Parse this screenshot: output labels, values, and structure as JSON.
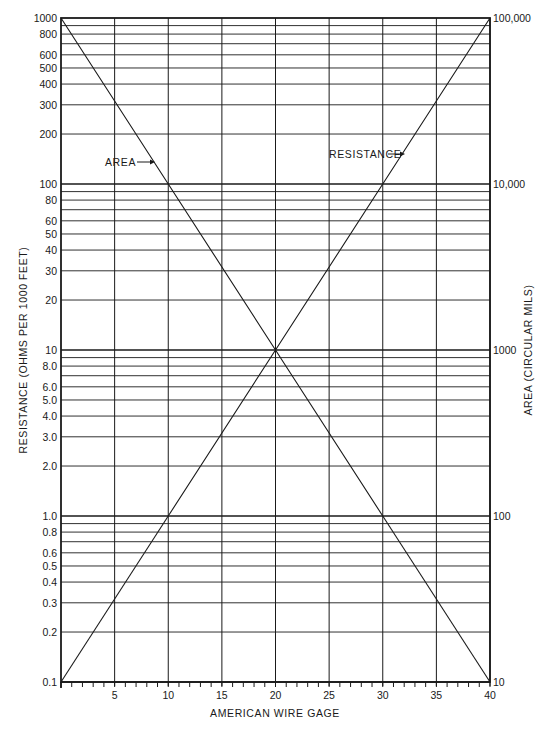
{
  "chart_data": {
    "type": "line",
    "title": "",
    "xlabel": "AMERICAN WIRE GAGE",
    "ylabel": "RESISTANCE (OHMS PER 1000 FEET)",
    "y2label": "AREA (CIRCULAR MILS)",
    "xlim": [
      0,
      40
    ],
    "ylim": [
      0.1,
      1000
    ],
    "y2lim": [
      10,
      100000
    ],
    "yscale": "log",
    "y2scale": "log",
    "grid": true,
    "x_ticks": [
      5,
      10,
      15,
      20,
      25,
      30,
      35,
      40
    ],
    "x_tick_labels": [
      "5",
      "10",
      "15",
      "20",
      "25",
      "30",
      "35",
      "40"
    ],
    "x_minor_tick_step": 1,
    "y_ticks": [
      1000,
      800,
      600,
      500,
      400,
      300,
      200,
      100,
      80,
      60,
      50,
      40,
      30,
      20,
      10,
      8.0,
      6.0,
      5.0,
      4.0,
      3.0,
      2.0,
      1.0,
      0.8,
      0.6,
      0.5,
      0.4,
      0.3,
      0.2,
      0.1
    ],
    "y_tick_labels": [
      "1000",
      "800",
      "600",
      "500",
      "400",
      "300",
      "200",
      "100",
      "80",
      "60",
      "50",
      "40",
      "30",
      "20",
      "10",
      "8.0",
      "6.0",
      "5.0",
      "4.0",
      "3.0",
      "2.0",
      "1.0",
      "0.8",
      "0.6",
      "0.5",
      "0.4",
      "0.3",
      "0.2",
      "0.1"
    ],
    "y2_ticks": [
      100000,
      10000,
      1000,
      100,
      10
    ],
    "y2_tick_labels": [
      "100,000",
      "10,000",
      "1000",
      "100",
      "10"
    ],
    "series": [
      {
        "name": "RESISTANCE",
        "axis": "left",
        "x": [
          0,
          10,
          20,
          30,
          40
        ],
        "values": [
          0.1,
          1,
          10,
          100,
          1000
        ]
      },
      {
        "name": "AREA",
        "axis": "right",
        "x": [
          0,
          10,
          20,
          30,
          40
        ],
        "values": [
          100000,
          10000,
          1000,
          100,
          10
        ]
      }
    ],
    "annotations": [
      {
        "text": "AREA",
        "arrow_to": "AREA line",
        "x": 9.5,
        "y": 150
      },
      {
        "text": "RESISTANCE",
        "arrow_to": "RESISTANCE line",
        "x": 29.5,
        "y": 150
      }
    ]
  },
  "labels": {
    "xlabel": "AMERICAN WIRE GAGE",
    "ylabel": "RESISTANCE (OHMS PER 1000 FEET)",
    "y2label": "AREA (CIRCULAR MILS)",
    "area_annotation": "AREA",
    "resistance_annotation": "RESISTANCE"
  }
}
